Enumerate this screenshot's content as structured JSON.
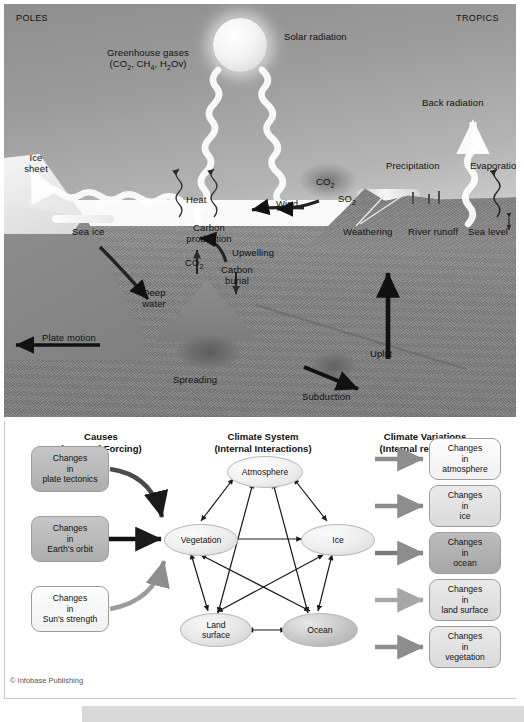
{
  "diagram": {
    "copyright": "© Infobase Publishing"
  },
  "upper_panel": {
    "name": "earth-climate-cross-section",
    "corner_labels": {
      "left": "POLES",
      "right": "TROPICS"
    },
    "labels": [
      {
        "key": "greenhouse",
        "line1": "Greenhouse gases",
        "line2_pre": "(CO",
        "line2_sub1": "2",
        "line2_mid": ", CH",
        "line2_sub2": "4",
        "line2_mid2": ", H",
        "line2_sub3": "2",
        "line2_post": "Ov)"
      },
      {
        "key": "solar_radiation",
        "text": "Solar radiation"
      },
      {
        "key": "back_radiation",
        "text": "Back radiation"
      },
      {
        "key": "ice_sheet",
        "line1": "Ice",
        "line2": "sheet"
      },
      {
        "key": "sea_ice",
        "text": "Sea ice"
      },
      {
        "key": "heat",
        "text": "Heat"
      },
      {
        "key": "carbon_production",
        "line1": "Carbon",
        "line2": "production"
      },
      {
        "key": "upwelling",
        "text": "Upwelling"
      },
      {
        "key": "wind",
        "text": "Wind"
      },
      {
        "key": "co2_air",
        "text": "CO",
        "sub": "2"
      },
      {
        "key": "so2",
        "text": "SO",
        "sub": "2"
      },
      {
        "key": "co2_sea",
        "text": "CO",
        "sub": "2"
      },
      {
        "key": "carbon_burial",
        "line1": "Carbon",
        "line2": "burial"
      },
      {
        "key": "deep_water",
        "line1": "Deep",
        "line2": "water"
      },
      {
        "key": "plate_motion",
        "text": "Plate motion"
      },
      {
        "key": "spreading",
        "text": "Spreading"
      },
      {
        "key": "subduction",
        "text": "Subduction"
      },
      {
        "key": "uplift",
        "text": "Uplift"
      },
      {
        "key": "weathering",
        "text": "Weathering"
      },
      {
        "key": "river_runoff",
        "text": "River runoff"
      },
      {
        "key": "sea_level",
        "text": "Sea level"
      },
      {
        "key": "precipitation",
        "text": "Precipitation"
      },
      {
        "key": "evaporation",
        "text": "Evaporation"
      }
    ]
  },
  "lower_panel": {
    "name": "climate-system-flow-diagram",
    "columns": [
      {
        "key": "causes",
        "line1": "Causes",
        "line2": "(External Forcing)"
      },
      {
        "key": "climate_system",
        "line1": "Climate System",
        "line2": "(Internal Interactions)"
      },
      {
        "key": "climate_variations",
        "line1": "Climate Variations",
        "line2": "(Internal responses)"
      }
    ],
    "causes": [
      {
        "key": "plate_tectonics",
        "line1": "Changes",
        "line2": "in",
        "line3": "plate tectonics",
        "shade": "dark"
      },
      {
        "key": "earths_orbit",
        "line1": "Changes",
        "line2": "in",
        "line3": "Earth's orbit",
        "shade": "dark"
      },
      {
        "key": "suns_strength",
        "line1": "Changes",
        "line2": "in",
        "line3": "Sun's strength",
        "shade": "light"
      }
    ],
    "components": [
      {
        "key": "atmosphere",
        "label": "Atmosphere"
      },
      {
        "key": "vegetation",
        "label": "Vegetation"
      },
      {
        "key": "ice",
        "label": "Ice"
      },
      {
        "key": "land_surface",
        "line1": "Land",
        "line2": "surface"
      },
      {
        "key": "ocean",
        "label": "Ocean"
      }
    ],
    "variations": [
      {
        "key": "atmosphere",
        "line1": "Changes",
        "line2": "in",
        "line3": "atmosphere",
        "shade": "light"
      },
      {
        "key": "ice",
        "line1": "Changes",
        "line2": "in",
        "line3": "ice",
        "shade": "mid2"
      },
      {
        "key": "ocean",
        "line1": "Changes",
        "line2": "in",
        "line3": "ocean",
        "shade": "darker"
      },
      {
        "key": "land_surface",
        "line1": "Changes",
        "line2": "in",
        "line3": "land surface",
        "shade": "mid2"
      },
      {
        "key": "vegetation",
        "line1": "Changes",
        "line2": "in",
        "line3": "vegetation",
        "shade": "mid2"
      }
    ]
  },
  "colors": {
    "sky": "#9b9b9b",
    "rock": "#858585",
    "water": "#f4f4f4",
    "ice": "#fafafa",
    "arrow_dark": "#111111",
    "arrow_gray": "#8d8d8d",
    "panel_border": "#c9c9c9"
  }
}
